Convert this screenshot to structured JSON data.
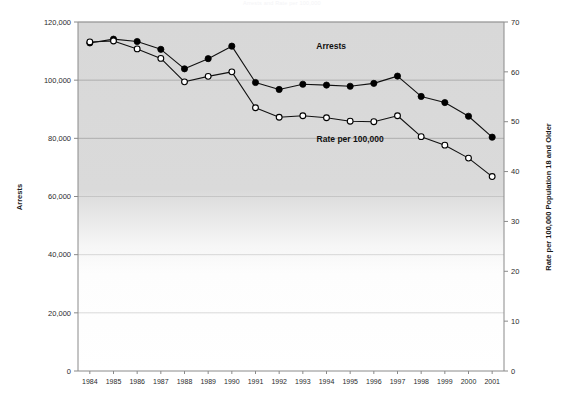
{
  "title": "Arrests and Rate per 100,000",
  "chart_data": {
    "type": "line",
    "title": "Arrests and Rate per 100,000",
    "xlabel": "",
    "x": [
      1984,
      1985,
      1986,
      1987,
      1988,
      1989,
      1990,
      1991,
      1992,
      1993,
      1994,
      1995,
      1996,
      1997,
      1998,
      1999,
      2000,
      2001
    ],
    "grid": true,
    "legend_position": "inline-annotations",
    "axes": {
      "left": {
        "label": "Arrests",
        "min": 0,
        "max": 120000,
        "step": 20000,
        "ticks": [
          "0",
          "20,000",
          "40,000",
          "60,000",
          "80,000",
          "100,000",
          "120,000"
        ]
      },
      "right": {
        "label": "Rate per 100,000 Population 18 and Older",
        "min": 0,
        "max": 70,
        "step": 10,
        "ticks": [
          "0",
          "10",
          "20",
          "30",
          "40",
          "50",
          "60",
          "70"
        ]
      }
    },
    "series": [
      {
        "name": "Arrests",
        "axis": "left",
        "marker": "filled-circle",
        "annotation": "Arrests",
        "values": [
          112800,
          114100,
          113300,
          110600,
          103900,
          107400,
          111700,
          99200,
          96800,
          98600,
          98300,
          97900,
          98900,
          101400,
          94400,
          92300,
          87600,
          80400
        ]
      },
      {
        "name": "Rate per 100,000",
        "axis": "right",
        "marker": "open-circle",
        "annotation": "Rate per 100,000",
        "values": [
          66.0,
          66.2,
          64.6,
          62.7,
          58.0,
          59.1,
          60.0,
          52.8,
          50.9,
          51.2,
          50.8,
          50.1,
          50.0,
          51.2,
          47.0,
          45.3,
          42.7,
          39.0
        ]
      }
    ],
    "annotations": [
      {
        "text": "Arrests",
        "x": 1994.2,
        "y_left": 110800
      },
      {
        "text": "Rate per 100,000",
        "x": 1995.0,
        "y_left": 78800
      }
    ]
  },
  "colors": {
    "plot_background_shaded": "#d9d9d9",
    "plot_background_plain": "#ffffff",
    "gridline": "#9a9a9a",
    "axis": "#8a8a8a",
    "series_arrests": "#000000",
    "series_rate_fill": "#ffffff",
    "series_rate_stroke": "#000000",
    "text": "#1a1a1a"
  }
}
